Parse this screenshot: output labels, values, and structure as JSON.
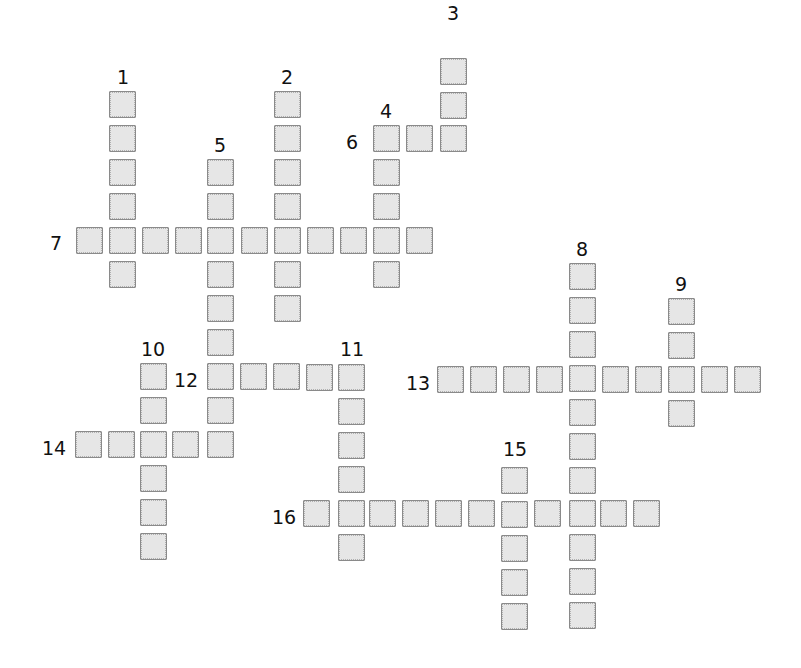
{
  "puzzle": {
    "type": "crossword",
    "cell_size": 27,
    "cell_fill": "#e6e6e6",
    "cell_border": "#8a8a8a",
    "words": [
      {
        "number": "1",
        "direction": "down",
        "length": 6,
        "cells": [
          [
            109,
            91
          ],
          [
            109,
            125
          ],
          [
            109,
            159
          ],
          [
            109,
            193
          ],
          [
            109,
            227
          ],
          [
            109,
            261
          ]
        ],
        "label_pos": [
          117,
          68
        ]
      },
      {
        "number": "2",
        "direction": "down",
        "length": 7,
        "cells": [
          [
            274,
            91
          ],
          [
            274,
            125
          ],
          [
            274,
            159
          ],
          [
            274,
            193
          ],
          [
            274,
            227
          ],
          [
            274,
            261
          ],
          [
            274,
            295
          ]
        ],
        "label_pos": [
          281,
          68
        ]
      },
      {
        "number": "3",
        "direction": "down",
        "length": 3,
        "cells": [
          [
            440,
            58
          ],
          [
            440,
            92
          ],
          [
            440,
            125
          ]
        ],
        "label_pos": [
          447,
          4
        ]
      },
      {
        "number": "4",
        "direction": "down",
        "length": 5,
        "cells": [
          [
            373,
            125
          ],
          [
            373,
            159
          ],
          [
            373,
            193
          ],
          [
            373,
            227
          ],
          [
            373,
            261
          ]
        ],
        "label_pos": [
          380,
          102
        ]
      },
      {
        "number": "5",
        "direction": "down",
        "length": 9,
        "cells": [
          [
            207,
            159
          ],
          [
            207,
            193
          ],
          [
            207,
            227
          ],
          [
            207,
            261
          ],
          [
            207,
            295
          ],
          [
            207,
            329
          ],
          [
            207,
            363
          ],
          [
            207,
            397
          ],
          [
            207,
            431
          ]
        ],
        "label_pos": [
          214,
          136
        ]
      },
      {
        "number": "6",
        "direction": "across",
        "length": 3,
        "cells": [
          [
            373,
            125
          ],
          [
            406,
            125
          ],
          [
            440,
            125
          ]
        ],
        "label_pos": [
          346,
          133
        ]
      },
      {
        "number": "7",
        "direction": "across",
        "length": 11,
        "cells": [
          [
            76,
            227
          ],
          [
            109,
            227
          ],
          [
            142,
            227
          ],
          [
            175,
            227
          ],
          [
            207,
            227
          ],
          [
            241,
            227
          ],
          [
            274,
            227
          ],
          [
            307,
            227
          ],
          [
            340,
            227
          ],
          [
            373,
            227
          ],
          [
            406,
            227
          ]
        ],
        "label_pos": [
          50,
          234
        ]
      },
      {
        "number": "8",
        "direction": "down",
        "length": 11,
        "cells": [
          [
            569,
            263
          ],
          [
            569,
            297
          ],
          [
            569,
            331
          ],
          [
            569,
            365
          ],
          [
            569,
            399
          ],
          [
            569,
            433
          ],
          [
            569,
            467
          ],
          [
            569,
            500
          ],
          [
            569,
            534
          ],
          [
            569,
            568
          ],
          [
            569,
            602
          ]
        ],
        "label_pos": [
          576,
          240
        ]
      },
      {
        "number": "9",
        "direction": "down",
        "length": 4,
        "cells": [
          [
            668,
            298
          ],
          [
            668,
            332
          ],
          [
            668,
            366
          ],
          [
            668,
            400
          ]
        ],
        "label_pos": [
          675,
          275
        ]
      },
      {
        "number": "10",
        "direction": "down",
        "length": 6,
        "cells": [
          [
            140,
            363
          ],
          [
            140,
            397
          ],
          [
            140,
            431
          ],
          [
            140,
            465
          ],
          [
            140,
            499
          ],
          [
            140,
            533
          ]
        ],
        "label_pos": [
          141,
          340
        ]
      },
      {
        "number": "11",
        "direction": "down",
        "length": 6,
        "cells": [
          [
            338,
            364
          ],
          [
            338,
            398
          ],
          [
            338,
            432
          ],
          [
            338,
            466
          ],
          [
            338,
            500
          ],
          [
            338,
            534
          ]
        ],
        "label_pos": [
          340,
          340
        ]
      },
      {
        "number": "12",
        "direction": "across",
        "length": 5,
        "cells": [
          [
            207,
            363
          ],
          [
            240,
            363
          ],
          [
            273,
            363
          ],
          [
            306,
            364
          ],
          [
            338,
            364
          ]
        ],
        "label_pos": [
          174,
          371
        ]
      },
      {
        "number": "13",
        "direction": "across",
        "length": 10,
        "cells": [
          [
            437,
            366
          ],
          [
            470,
            366
          ],
          [
            503,
            366
          ],
          [
            536,
            366
          ],
          [
            569,
            365
          ],
          [
            602,
            366
          ],
          [
            635,
            366
          ],
          [
            668,
            366
          ],
          [
            701,
            366
          ],
          [
            734,
            366
          ]
        ],
        "label_pos": [
          406,
          374
        ]
      },
      {
        "number": "14",
        "direction": "across",
        "length": 5,
        "cells": [
          [
            75,
            431
          ],
          [
            108,
            431
          ],
          [
            140,
            431
          ],
          [
            172,
            431
          ],
          [
            207,
            431
          ]
        ],
        "label_pos": [
          42,
          439
        ]
      },
      {
        "number": "15",
        "direction": "down",
        "length": 5,
        "cells": [
          [
            501,
            467
          ],
          [
            501,
            501
          ],
          [
            501,
            535
          ],
          [
            501,
            569
          ],
          [
            501,
            603
          ]
        ],
        "label_pos": [
          503,
          440
        ]
      },
      {
        "number": "16",
        "direction": "across",
        "length": 11,
        "cells": [
          [
            303,
            500
          ],
          [
            338,
            500
          ],
          [
            369,
            500
          ],
          [
            402,
            500
          ],
          [
            435,
            500
          ],
          [
            468,
            500
          ],
          [
            501,
            501
          ],
          [
            534,
            500
          ],
          [
            569,
            500
          ],
          [
            600,
            500
          ],
          [
            633,
            500
          ]
        ],
        "label_pos": [
          272,
          508
        ]
      }
    ]
  }
}
